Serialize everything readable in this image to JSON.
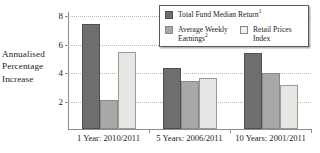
{
  "chart_data": {
    "type": "bar",
    "title": "",
    "xlabel": "",
    "ylabel": "Annualised Percentage Increase",
    "ylim": [
      0,
      8
    ],
    "yticks": [
      2,
      4,
      6,
      8
    ],
    "grid": true,
    "legend_position": "top-right",
    "categories": [
      "1 Year: 2010/2011",
      "5 Years: 2006/2011",
      "10 Years: 2001/2011"
    ],
    "series": [
      {
        "name": "Total Fund Median Return",
        "footnote": "1",
        "color": "#6e6e6e",
        "values": [
          7.4,
          4.25,
          5.3
        ]
      },
      {
        "name": "Average Weekly Earnings",
        "footnote": "2",
        "color": "#a8a8a8",
        "values": [
          2.05,
          3.4,
          3.9
        ]
      },
      {
        "name": "Retail Prices Index",
        "footnote": "",
        "color": "#e6e6e2",
        "values": [
          5.4,
          3.6,
          3.1
        ]
      }
    ]
  },
  "axis_caption": {
    "line1": "Annualised",
    "line2": "Percentage",
    "line3": "Increase"
  },
  "legend": {
    "entries": [
      {
        "label": "Total Fund Median Return",
        "footnote": "1"
      },
      {
        "label": "Average Weekly\nEarnings",
        "footnote": "2"
      },
      {
        "label": "Retail Prices\nIndex",
        "footnote": ""
      }
    ]
  }
}
